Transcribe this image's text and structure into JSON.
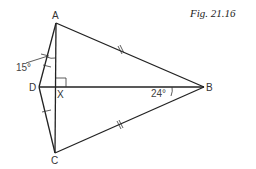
{
  "figure": {
    "caption": "Fig. 21.16",
    "points": {
      "A": {
        "label": "A",
        "x": 56,
        "y": 23
      },
      "B": {
        "label": "B",
        "x": 204,
        "y": 87
      },
      "C": {
        "label": "C",
        "x": 55,
        "y": 153
      },
      "D": {
        "label": "D",
        "x": 39,
        "y": 87
      },
      "X": {
        "label": "X",
        "x": 56,
        "y": 87
      }
    },
    "angles": {
      "at_A": "15°",
      "at_B": "24°"
    },
    "segments": [
      "AB",
      "BC",
      "AD",
      "DC",
      "AC",
      "DB"
    ],
    "marks": {
      "equal_single": [
        "AD",
        "DC"
      ],
      "equal_double": [
        "AB",
        "CB"
      ],
      "right_angle": "X"
    },
    "colors": {
      "line": "#222222",
      "background": "#ffffff"
    }
  }
}
